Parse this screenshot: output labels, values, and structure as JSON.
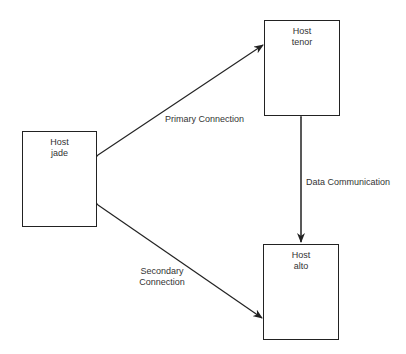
{
  "diagram": {
    "nodes": [
      {
        "id": "jade",
        "line1": "Host",
        "line2": "jade"
      },
      {
        "id": "tenor",
        "line1": "Host",
        "line2": "tenor"
      },
      {
        "id": "alto",
        "line1": "Host",
        "line2": "alto"
      }
    ],
    "edges": [
      {
        "from": "jade",
        "to": "tenor",
        "label": "Primary Connection",
        "direction": "bidirectional"
      },
      {
        "from": "tenor",
        "to": "alto",
        "label": "Data Communication",
        "direction": "bidirectional"
      },
      {
        "from": "jade",
        "to": "alto",
        "label_line1": "Secondary",
        "label_line2": "Connection",
        "direction": "bidirectional"
      }
    ]
  }
}
